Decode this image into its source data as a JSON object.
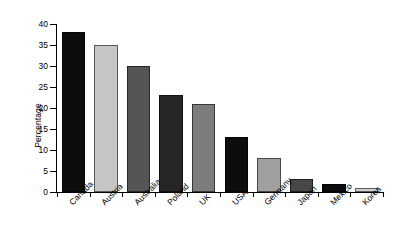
{
  "chart_data": {
    "type": "bar",
    "title": "",
    "subtitle": "",
    "xlabel": "",
    "ylabel": "Percentage",
    "categories": [
      "Canada",
      "Austria",
      "Australia",
      "Poland",
      "UK",
      "USA",
      "Germany",
      "Japan",
      "Mexico",
      "Korea"
    ],
    "values": [
      38,
      35,
      30,
      23,
      21,
      13,
      8,
      3,
      2,
      1
    ],
    "bar_colors": [
      "#0d0d0d",
      "#c6c6c6",
      "#555555",
      "#262626",
      "#7d7d7d",
      "#0d0d0d",
      "#a0a0a0",
      "#474747",
      "#0d0d0d",
      "#cfcfcf"
    ],
    "ylim": [
      0,
      40
    ],
    "ytick_values": [
      0,
      5,
      10,
      15,
      20,
      25,
      30,
      35,
      40
    ],
    "ytick_labels": [
      "0",
      "5",
      "10",
      "15",
      "20",
      "25",
      "30",
      "35",
      "40"
    ],
    "grid": false,
    "legend": null,
    "legend_position": "none",
    "annotations": [],
    "background_color": "#ffffff",
    "axis_color": "#000000",
    "xtick_label_rotation": -45
  }
}
